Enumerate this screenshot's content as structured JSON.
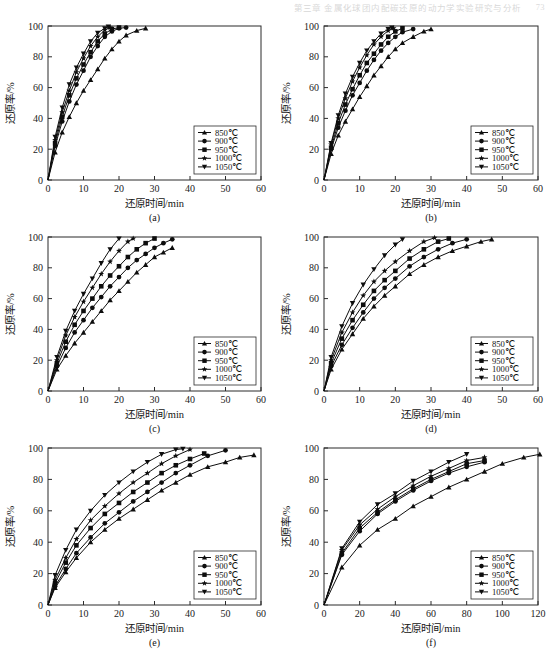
{
  "running_head": {
    "title": "第三章 金属化球团内配碳还原的动力学实验研究与分析",
    "page": "73"
  },
  "legend_series": [
    {
      "label": "850℃",
      "marker": "triangle-up"
    },
    {
      "label": "900℃",
      "marker": "circle"
    },
    {
      "label": "950℃",
      "marker": "square"
    },
    {
      "label": "1000℃",
      "marker": "star"
    },
    {
      "label": "1050℃",
      "marker": "triangle-down"
    }
  ],
  "axes": {
    "xlabel": "还原时间/min",
    "ylabel": "还原率/%",
    "yticks": [
      0,
      20,
      40,
      60,
      80,
      100
    ],
    "xticks_60": [
      0,
      10,
      20,
      30,
      40,
      50,
      60
    ],
    "xticks_120": [
      0,
      20,
      40,
      60,
      80,
      100,
      120
    ]
  },
  "panel_labels": [
    "(a)",
    "(b)",
    "(c)",
    "(d)",
    "(e)",
    "(f)"
  ],
  "chart_data": [
    {
      "id": "a",
      "type": "line",
      "title": "(a)",
      "xlabel": "还原时间/min",
      "ylabel": "还原率/%",
      "xlim": [
        0,
        60
      ],
      "ylim": [
        0,
        100
      ],
      "xticks": [
        0,
        10,
        20,
        30,
        40,
        50,
        60
      ],
      "yticks": [
        0,
        20,
        40,
        60,
        80,
        100
      ],
      "grid": false,
      "legend_position": "lower-right",
      "series": [
        {
          "name": "850℃",
          "marker": "triangle-up",
          "x": [
            0,
            2,
            4,
            6,
            8,
            10,
            12,
            14,
            16,
            18,
            20,
            22,
            25,
            27.5
          ],
          "y": [
            0,
            18,
            31,
            41,
            50,
            58,
            65,
            72,
            79,
            85,
            90,
            94,
            97,
            98.5
          ]
        },
        {
          "name": "900℃",
          "marker": "circle",
          "x": [
            0,
            2,
            4,
            6,
            8,
            10,
            12,
            14,
            16,
            18,
            20,
            22
          ],
          "y": [
            0,
            22,
            38,
            51,
            62,
            71,
            80,
            87,
            93,
            96.5,
            98.5,
            99
          ]
        },
        {
          "name": "950℃",
          "marker": "square",
          "x": [
            0,
            2,
            4,
            6,
            8,
            10,
            12,
            14,
            16,
            18,
            20
          ],
          "y": [
            0,
            24,
            41,
            55,
            66,
            75,
            83,
            90,
            95,
            98,
            99
          ]
        },
        {
          "name": "1000℃",
          "marker": "star",
          "x": [
            0,
            2,
            4,
            6,
            8,
            10,
            12,
            14,
            16,
            17.5
          ],
          "y": [
            0,
            26,
            44,
            58,
            70,
            79,
            87,
            93,
            97.5,
            99
          ]
        },
        {
          "name": "1050℃",
          "marker": "triangle-down",
          "x": [
            0,
            2,
            4,
            6,
            8,
            10,
            12,
            14,
            16,
            17
          ],
          "y": [
            0,
            28,
            47,
            62,
            73,
            82,
            90,
            95.5,
            98.5,
            99.5
          ]
        }
      ]
    },
    {
      "id": "b",
      "type": "line",
      "title": "(b)",
      "xlabel": "还原时间/min",
      "ylabel": "还原率/%",
      "xlim": [
        0,
        60
      ],
      "ylim": [
        0,
        100
      ],
      "xticks": [
        0,
        10,
        20,
        30,
        40,
        50,
        60
      ],
      "yticks": [
        0,
        20,
        40,
        60,
        80,
        100
      ],
      "grid": false,
      "legend_position": "lower-right",
      "series": [
        {
          "name": "850℃",
          "marker": "triangle-up",
          "x": [
            0,
            2,
            4,
            6,
            8,
            10,
            12,
            14,
            16,
            18,
            20,
            22,
            25,
            28,
            30
          ],
          "y": [
            0,
            17,
            29,
            38,
            46,
            54,
            61,
            68,
            74,
            80,
            85,
            89,
            93,
            96.5,
            98
          ]
        },
        {
          "name": "900℃",
          "marker": "circle",
          "x": [
            0,
            2,
            4,
            6,
            8,
            10,
            12,
            14,
            16,
            18,
            20,
            22,
            25
          ],
          "y": [
            0,
            20,
            34,
            45,
            55,
            63,
            71,
            78,
            84,
            89,
            93,
            96,
            98
          ]
        },
        {
          "name": "950℃",
          "marker": "square",
          "x": [
            0,
            2,
            4,
            6,
            8,
            10,
            12,
            14,
            16,
            18,
            20,
            22
          ],
          "y": [
            0,
            21,
            37,
            49,
            59,
            68,
            76,
            82,
            88,
            93,
            96.5,
            98.5
          ]
        },
        {
          "name": "1000℃",
          "marker": "star",
          "x": [
            0,
            2,
            4,
            6,
            8,
            10,
            12,
            14,
            16,
            18,
            19.5
          ],
          "y": [
            0,
            23,
            40,
            53,
            64,
            73,
            81,
            88,
            93,
            97,
            98.5
          ]
        },
        {
          "name": "1050℃",
          "marker": "triangle-down",
          "x": [
            0,
            2,
            4,
            6,
            8,
            10,
            12,
            14,
            16,
            18,
            19
          ],
          "y": [
            0,
            24,
            42,
            56,
            67,
            76,
            84,
            90,
            95,
            98,
            99
          ]
        }
      ]
    },
    {
      "id": "c",
      "type": "line",
      "title": "(c)",
      "xlabel": "还原时间/min",
      "ylabel": "还原率/%",
      "xlim": [
        0,
        60
      ],
      "ylim": [
        0,
        100
      ],
      "xticks": [
        0,
        10,
        20,
        30,
        40,
        50,
        60
      ],
      "yticks": [
        0,
        20,
        40,
        60,
        80,
        100
      ],
      "grid": false,
      "legend_position": "lower-right",
      "series": [
        {
          "name": "850℃",
          "marker": "triangle-up",
          "x": [
            0,
            2.5,
            5,
            7.5,
            10,
            12.5,
            15,
            17.5,
            20,
            22.5,
            25,
            27.5,
            30,
            32.5,
            35
          ],
          "y": [
            0,
            14,
            23,
            31,
            38,
            45,
            52,
            59,
            65,
            71,
            77,
            82,
            87,
            90,
            93
          ]
        },
        {
          "name": "900℃",
          "marker": "circle",
          "x": [
            0,
            2.5,
            5,
            7.5,
            10,
            12.5,
            15,
            17.5,
            20,
            22.5,
            25,
            27.5,
            30,
            32.5,
            35
          ],
          "y": [
            0,
            16,
            28,
            38,
            46,
            54,
            61,
            68,
            74,
            80,
            85,
            89,
            93,
            96,
            98.5
          ]
        },
        {
          "name": "950℃",
          "marker": "square",
          "x": [
            0,
            2.5,
            5,
            7.5,
            10,
            12.5,
            15,
            17.5,
            20,
            22.5,
            25,
            27.5,
            30
          ],
          "y": [
            0,
            18,
            32,
            43,
            52,
            60,
            68,
            75,
            81,
            87,
            92,
            96,
            99
          ]
        },
        {
          "name": "1000℃",
          "marker": "star",
          "x": [
            0,
            2.5,
            5,
            7.5,
            10,
            12.5,
            15,
            17.5,
            20,
            22.5,
            24
          ],
          "y": [
            0,
            20,
            36,
            48,
            58,
            67,
            76,
            84,
            91,
            97,
            99
          ]
        },
        {
          "name": "1050℃",
          "marker": "triangle-down",
          "x": [
            0,
            2.5,
            5,
            7.5,
            10,
            12.5,
            15,
            17.5,
            20
          ],
          "y": [
            0,
            22,
            39,
            52,
            63,
            73,
            83,
            92,
            99
          ]
        }
      ]
    },
    {
      "id": "d",
      "type": "line",
      "title": "(d)",
      "xlabel": "还原时间/min",
      "ylabel": "还原率/%",
      "xlim": [
        0,
        60
      ],
      "ylim": [
        0,
        100
      ],
      "xticks": [
        0,
        10,
        20,
        30,
        40,
        50,
        60
      ],
      "yticks": [
        0,
        20,
        40,
        60,
        80,
        100
      ],
      "grid": false,
      "legend_position": "lower-right",
      "series": [
        {
          "name": "850℃",
          "marker": "triangle-up",
          "x": [
            0,
            2,
            5,
            8,
            11,
            14,
            17,
            20,
            24,
            28,
            32,
            36,
            40,
            44,
            47
          ],
          "y": [
            0,
            14,
            27,
            37,
            47,
            55,
            62,
            68,
            76,
            82,
            87,
            91,
            94,
            97,
            98.5
          ]
        },
        {
          "name": "900℃",
          "marker": "circle",
          "x": [
            0,
            2,
            5,
            8,
            11,
            14,
            17,
            20,
            24,
            28,
            32,
            36,
            40
          ],
          "y": [
            0,
            16,
            30,
            41,
            51,
            60,
            67,
            73,
            81,
            87,
            92,
            96,
            98.5
          ]
        },
        {
          "name": "950℃",
          "marker": "square",
          "x": [
            0,
            2,
            5,
            8,
            11,
            14,
            17,
            20,
            24,
            28,
            32,
            35
          ],
          "y": [
            0,
            18,
            34,
            46,
            56,
            65,
            72,
            78,
            86,
            92,
            97,
            99
          ]
        },
        {
          "name": "1000℃",
          "marker": "star",
          "x": [
            0,
            2,
            5,
            8,
            11,
            14,
            17,
            20,
            24,
            28,
            31
          ],
          "y": [
            0,
            20,
            38,
            51,
            62,
            71,
            78,
            84,
            91,
            97,
            99.5
          ]
        },
        {
          "name": "1050℃",
          "marker": "triangle-down",
          "x": [
            0,
            2,
            5,
            8,
            11,
            14,
            17,
            20,
            22
          ],
          "y": [
            0,
            22,
            42,
            57,
            69,
            79,
            88,
            95,
            98.5
          ]
        }
      ]
    },
    {
      "id": "e",
      "type": "line",
      "title": "(e)",
      "xlabel": "还原时间/min",
      "ylabel": "还原率/%",
      "xlim": [
        0,
        60
      ],
      "ylim": [
        0,
        100
      ],
      "xticks": [
        0,
        10,
        20,
        30,
        40,
        50,
        60
      ],
      "yticks": [
        0,
        20,
        40,
        60,
        80,
        100
      ],
      "grid": false,
      "legend_position": "lower-right",
      "series": [
        {
          "name": "850℃",
          "marker": "triangle-up",
          "x": [
            0,
            2,
            5,
            8,
            12,
            16,
            20,
            24,
            28,
            32,
            36,
            40,
            45,
            50,
            54,
            58
          ],
          "y": [
            0,
            11,
            21,
            30,
            40,
            48,
            55,
            61,
            67,
            73,
            78,
            83,
            88,
            91,
            94,
            95.5
          ]
        },
        {
          "name": "900℃",
          "marker": "circle",
          "x": [
            0,
            2,
            5,
            8,
            12,
            16,
            20,
            24,
            28,
            32,
            36,
            40,
            45,
            50
          ],
          "y": [
            0,
            12,
            23,
            33,
            43,
            52,
            59,
            66,
            72,
            78,
            84,
            89,
            95,
            98.5
          ]
        },
        {
          "name": "950℃",
          "marker": "square",
          "x": [
            0,
            2,
            5,
            8,
            12,
            16,
            20,
            24,
            28,
            32,
            36,
            40,
            44
          ],
          "y": [
            0,
            14,
            27,
            38,
            49,
            58,
            65,
            72,
            78,
            84,
            89,
            93,
            96.5
          ]
        },
        {
          "name": "1000℃",
          "marker": "star",
          "x": [
            0,
            2,
            5,
            8,
            12,
            16,
            20,
            24,
            28,
            32,
            36,
            40
          ],
          "y": [
            0,
            16,
            30,
            42,
            54,
            63,
            71,
            78,
            84,
            90,
            95,
            99
          ]
        },
        {
          "name": "1050℃",
          "marker": "triangle-down",
          "x": [
            0,
            2,
            5,
            8,
            12,
            16,
            20,
            24,
            28,
            32,
            36,
            38
          ],
          "y": [
            0,
            19,
            35,
            48,
            60,
            70,
            78,
            85,
            91,
            96,
            99,
            99.5
          ]
        }
      ]
    },
    {
      "id": "f",
      "type": "line",
      "title": "(f)",
      "xlabel": "还原时间/min",
      "ylabel": "还原率/%",
      "xlim": [
        0,
        120
      ],
      "ylim": [
        0,
        100
      ],
      "xticks": [
        0,
        20,
        40,
        60,
        80,
        100,
        120
      ],
      "yticks": [
        0,
        20,
        40,
        60,
        80,
        100
      ],
      "grid": false,
      "legend_position": "lower-right",
      "series": [
        {
          "name": "850℃",
          "marker": "triangle-up",
          "x": [
            0,
            10,
            20,
            30,
            40,
            50,
            60,
            70,
            80,
            90,
            100,
            112,
            121
          ],
          "y": [
            0,
            24,
            38,
            48,
            55,
            63,
            69,
            75,
            80,
            85,
            90,
            94,
            96
          ]
        },
        {
          "name": "900℃",
          "marker": "circle",
          "x": [
            0,
            10,
            20,
            30,
            40,
            50,
            60,
            70,
            80,
            90
          ],
          "y": [
            0,
            32,
            47,
            58,
            66,
            73,
            79,
            84,
            88,
            91
          ]
        },
        {
          "name": "950℃",
          "marker": "square",
          "x": [
            0,
            10,
            20,
            30,
            40,
            50,
            60,
            70,
            80,
            90
          ],
          "y": [
            0,
            33,
            49,
            59,
            67,
            74,
            80,
            85,
            90,
            92
          ]
        },
        {
          "name": "1000℃",
          "marker": "star",
          "x": [
            0,
            10,
            20,
            30,
            40,
            50,
            60,
            70,
            80,
            90
          ],
          "y": [
            0,
            35,
            51,
            61,
            69,
            76,
            82,
            87,
            92,
            94
          ]
        },
        {
          "name": "1050℃",
          "marker": "triangle-down",
          "x": [
            0,
            10,
            20,
            30,
            40,
            50,
            60,
            70,
            80
          ],
          "y": [
            0,
            36,
            53,
            64,
            71,
            79,
            85,
            91,
            96
          ]
        }
      ]
    }
  ]
}
